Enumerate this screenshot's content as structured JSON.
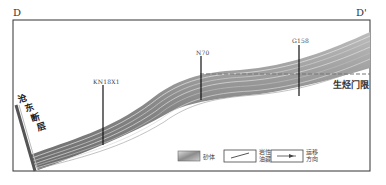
{
  "section": {
    "start_label": "D",
    "end_label": "D'"
  },
  "wells": [
    {
      "name": "KN18X1"
    },
    {
      "name": "N70"
    },
    {
      "name": "G158"
    }
  ],
  "annotations": {
    "fault": [
      "沧",
      "东",
      "断",
      "层"
    ],
    "hydrocarbon_threshold": "生烃门限"
  },
  "legend": {
    "sand_body": "砂体",
    "fault_line1": "岩性",
    "fault_line2": "油藏",
    "migration_line1": "运移",
    "migration_line2": "方向"
  },
  "colors": {
    "frame": "#333333",
    "strata_dark": "#6e6e6e",
    "strata_mid": "#9a9a9a",
    "strata_light": "#d8d8d8",
    "well": "#111111"
  }
}
